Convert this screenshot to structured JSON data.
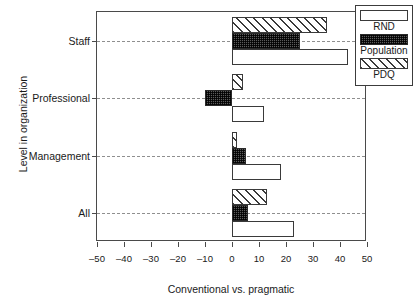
{
  "chart_data": {
    "type": "bar",
    "orientation": "horizontal",
    "title": "",
    "xlabel": "Conventional vs. pragmatic",
    "ylabel": "Level in organization",
    "categories": [
      "Staff",
      "Professional",
      "Management",
      "All"
    ],
    "xlim": [
      -50,
      50
    ],
    "xticks": [
      -50,
      -40,
      -30,
      -20,
      -10,
      0,
      10,
      20,
      30,
      40,
      50
    ],
    "xticklabels": [
      "-50",
      "-40",
      "-30",
      "-20",
      "-10",
      "0",
      "10",
      "20",
      "30",
      "40",
      "50"
    ],
    "grid": "horizontal-dashed",
    "legend_position": "outside-top-right",
    "series": [
      {
        "name": "PDQ",
        "fill": "hatched",
        "values": [
          35,
          4,
          2,
          13
        ]
      },
      {
        "name": "Population",
        "fill": "checkered",
        "values": [
          25,
          -10,
          5,
          6
        ]
      },
      {
        "name": "RND",
        "fill": "white",
        "values": [
          43,
          12,
          18,
          23
        ]
      }
    ],
    "series_order_top_to_bottom": [
      "PDQ",
      "Population",
      "RND"
    ]
  },
  "legend": {
    "entries": [
      {
        "label": "RND",
        "swatch": "white-swatch"
      },
      {
        "label": "Population",
        "swatch": "checkered-swatch"
      },
      {
        "label": "PDQ",
        "swatch": "hatched-swatch"
      }
    ]
  },
  "colors": {
    "axis": "#4a4a4a",
    "grid": "#8f8f8f",
    "bar_outline": "#3a3a3a",
    "population_fill": "#5b5b5b",
    "background": "#ffffff"
  }
}
